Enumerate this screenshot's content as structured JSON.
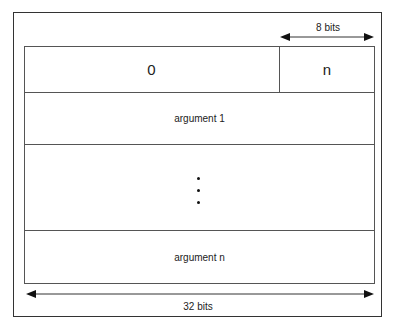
{
  "diagram": {
    "header": {
      "left_field": "0",
      "right_field": "n"
    },
    "rows": [
      {
        "label": "argument 1"
      },
      {
        "label": ""
      },
      {
        "label": "argument n"
      }
    ],
    "ellipsis": "vertical-dots",
    "dimensions": {
      "top": "8 bits",
      "bottom": "32 bits"
    }
  }
}
